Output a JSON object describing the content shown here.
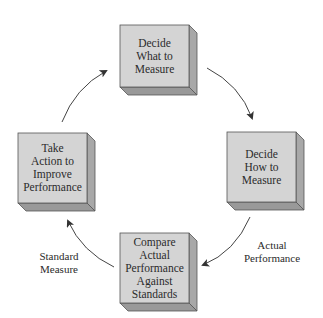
{
  "diagram": {
    "type": "cycle",
    "colors": {
      "box_front": "#d4d4d4",
      "box_side": "#a8a8a8",
      "box_bottom": "#9a9a9a",
      "box_border": "#555555",
      "arrow": "#444444"
    },
    "nodes": [
      {
        "id": "decide-what",
        "label": "Decide What to Measure",
        "lines": [
          "Decide",
          "What to",
          "Measure"
        ]
      },
      {
        "id": "decide-how",
        "label": "Decide How to Measure",
        "lines": [
          "Decide",
          "How to",
          "Measure"
        ]
      },
      {
        "id": "compare",
        "label": "Compare Actual Performance Against Standards",
        "lines": [
          "Compare",
          "Actual",
          "Performance",
          "Against",
          "Standards"
        ]
      },
      {
        "id": "take-action",
        "label": "Take Action to Improve Performance",
        "lines": [
          "Take",
          "Action to",
          "Improve",
          "Performance"
        ]
      }
    ],
    "edges": [
      {
        "from": "decide-what",
        "to": "decide-how",
        "label": ""
      },
      {
        "from": "decide-how",
        "to": "compare",
        "label": "Actual Performance",
        "lines": [
          "Actual",
          "Performance"
        ]
      },
      {
        "from": "compare",
        "to": "take-action",
        "label": "Standard Measure",
        "lines": [
          "Standard",
          "Measure"
        ]
      },
      {
        "from": "take-action",
        "to": "decide-what",
        "label": ""
      }
    ]
  }
}
